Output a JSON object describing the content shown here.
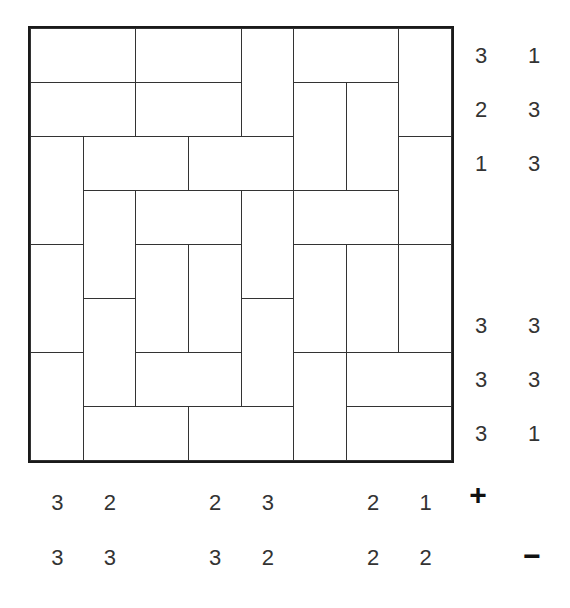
{
  "puzzle": {
    "type": "magnets",
    "rows": 8,
    "cols": 8,
    "dominoes": [
      {
        "r": 0,
        "c": 0,
        "o": "h"
      },
      {
        "r": 0,
        "c": 2,
        "o": "h"
      },
      {
        "r": 0,
        "c": 4,
        "o": "v"
      },
      {
        "r": 0,
        "c": 5,
        "o": "h"
      },
      {
        "r": 0,
        "c": 7,
        "o": "v"
      },
      {
        "r": 1,
        "c": 0,
        "o": "h"
      },
      {
        "r": 1,
        "c": 2,
        "o": "h"
      },
      {
        "r": 1,
        "c": 5,
        "o": "v"
      },
      {
        "r": 1,
        "c": 6,
        "o": "v"
      },
      {
        "r": 2,
        "c": 0,
        "o": "v"
      },
      {
        "r": 2,
        "c": 1,
        "o": "h"
      },
      {
        "r": 2,
        "c": 3,
        "o": "h"
      },
      {
        "r": 2,
        "c": 7,
        "o": "v"
      },
      {
        "r": 3,
        "c": 1,
        "o": "v"
      },
      {
        "r": 3,
        "c": 2,
        "o": "h"
      },
      {
        "r": 3,
        "c": 4,
        "o": "v"
      },
      {
        "r": 3,
        "c": 5,
        "o": "h"
      },
      {
        "r": 4,
        "c": 0,
        "o": "v"
      },
      {
        "r": 4,
        "c": 2,
        "o": "v"
      },
      {
        "r": 4,
        "c": 3,
        "o": "v"
      },
      {
        "r": 4,
        "c": 5,
        "o": "v"
      },
      {
        "r": 4,
        "c": 6,
        "o": "v"
      },
      {
        "r": 4,
        "c": 7,
        "o": "v"
      },
      {
        "r": 5,
        "c": 1,
        "o": "v"
      },
      {
        "r": 5,
        "c": 4,
        "o": "v"
      },
      {
        "r": 6,
        "c": 0,
        "o": "v"
      },
      {
        "r": 6,
        "c": 2,
        "o": "h"
      },
      {
        "r": 6,
        "c": 5,
        "o": "v"
      },
      {
        "r": 6,
        "c": 6,
        "o": "h"
      },
      {
        "r": 7,
        "c": 1,
        "o": "h"
      },
      {
        "r": 7,
        "c": 3,
        "o": "h"
      },
      {
        "r": 7,
        "c": 6,
        "o": "h"
      }
    ],
    "row_clues": {
      "plus": [
        "3",
        "2",
        "1",
        "",
        "",
        "3",
        "3",
        "3"
      ],
      "minus": [
        "1",
        "3",
        "3",
        "",
        "",
        "3",
        "3",
        "1"
      ]
    },
    "col_clues": {
      "plus": [
        "3",
        "2",
        "",
        "2",
        "3",
        "",
        "2",
        "1"
      ],
      "minus": [
        "3",
        "3",
        "",
        "3",
        "2",
        "",
        "2",
        "2"
      ]
    },
    "plus_symbol": "+",
    "minus_symbol": "−"
  }
}
